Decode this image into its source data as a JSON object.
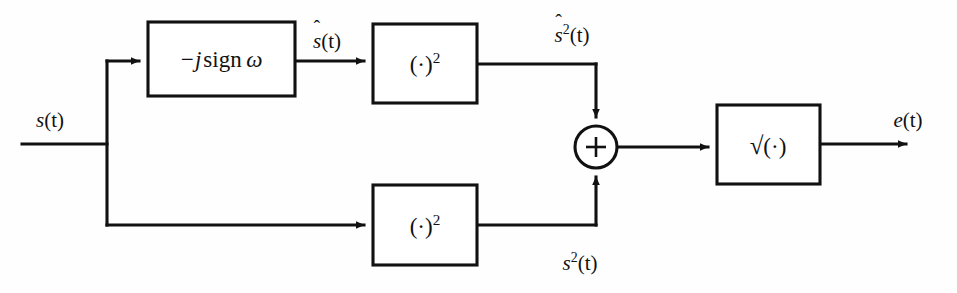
{
  "figure": {
    "kind": "block-diagram",
    "background_color": "#fefefe",
    "line_color": "#111111",
    "width": 957,
    "height": 293
  },
  "blocks": {
    "hilbert": {
      "name": "hilbert-transform-block",
      "label_minus_j": "−j",
      "label_sign": "sign",
      "label_omega": "ω",
      "x": 148,
      "y": 22,
      "w": 147,
      "h": 74
    },
    "square_upper": {
      "name": "square-block-upper",
      "label_open": "(",
      "label_dot": "·",
      "label_close": ")",
      "label_exponent": "2",
      "x": 373,
      "y": 24,
      "w": 104,
      "h": 79
    },
    "square_lower": {
      "name": "square-block-lower",
      "label_open": "(",
      "label_dot": "·",
      "label_close": ")",
      "label_exponent": "2",
      "x": 373,
      "y": 185,
      "w": 104,
      "h": 80
    },
    "sqrt": {
      "name": "square-root-block",
      "label_radical": "√",
      "label_open": "(",
      "label_dot": "·",
      "label_close": ")",
      "x": 717,
      "y": 105,
      "w": 103,
      "h": 79
    }
  },
  "adder": {
    "name": "summing-junction",
    "symbol": "+",
    "cx": 596,
    "cy": 147,
    "r": 21
  },
  "signals": {
    "input": {
      "name": "input-signal-label",
      "base": "s",
      "arg": "(t)",
      "hat": false,
      "exponent": "",
      "x": 50,
      "y": 120
    },
    "hilbert_output": {
      "name": "hilbert-output-label",
      "base": "s",
      "arg": "(t)",
      "hat": true,
      "exponent": "",
      "x": 327,
      "y": 40
    },
    "squared_hat": {
      "name": "squared-hilbert-label",
      "base": "s",
      "arg": "(t)",
      "hat": true,
      "exponent": "2",
      "x": 572,
      "y": 33
    },
    "squared_direct": {
      "name": "squared-direct-label",
      "base": "s",
      "arg": "(t)",
      "hat": false,
      "exponent": "2",
      "x": 580,
      "y": 262
    },
    "output": {
      "name": "output-signal-label",
      "base": "e",
      "arg": "(t)",
      "hat": false,
      "exponent": "",
      "x": 908,
      "y": 120
    }
  },
  "wires": {
    "input_trunk": "M 22 144 L 107 144",
    "branch_vertical": "M 107 61 L 107 225",
    "to_hilbert": "M 107 61 L 141 61",
    "hilbert_to_square": "M 295 61 L 366 61",
    "square_to_corner": "M 477 64 L 596 64",
    "corner_down_to_adder": "M 596 64 L 596 119",
    "branch_to_lower_square": "M 107 225 L 366 225",
    "lower_square_to_corner": "M 477 225 L 596 225",
    "corner_up_to_adder": "M 596 225 L 596 175",
    "adder_to_sqrt": "M 617 147 L 710 147",
    "sqrt_to_output": "M 820 144 L 908 144"
  }
}
